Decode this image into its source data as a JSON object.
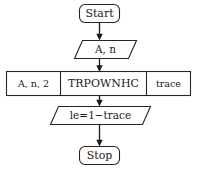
{
  "diagram": {
    "type": "flowchart",
    "orientation": "top-to-bottom",
    "colors": {
      "background": "#ffffff",
      "shape_fill": "#ffffff",
      "shape_stroke": "#262626",
      "text": "#1a1a1a",
      "connector": "#1a1a1a"
    },
    "nodes": {
      "start": {
        "label": "Start",
        "shape": "rounded-rectangle",
        "role": "terminator"
      },
      "input": {
        "label": "A, n",
        "shape": "parallelogram",
        "role": "input"
      },
      "process": {
        "shape": "rectangle",
        "role": "process-with-ports",
        "input_label": "A, n, 2",
        "name_label": "TRPOWNHC",
        "output_label": "trace"
      },
      "output": {
        "label": "le=1−trace",
        "shape": "parallelogram",
        "role": "output"
      },
      "stop": {
        "label": "Stop",
        "shape": "rounded-rectangle",
        "role": "terminator"
      }
    },
    "connectors": [
      {
        "from": "start",
        "to": "input",
        "style": "arrow",
        "label": ""
      },
      {
        "from": "input",
        "to": "process",
        "style": "arrow",
        "label": ""
      },
      {
        "from": "process",
        "to": "output",
        "style": "arrow",
        "label": ""
      },
      {
        "from": "output",
        "to": "stop",
        "style": "arrow",
        "label": ""
      }
    ]
  }
}
